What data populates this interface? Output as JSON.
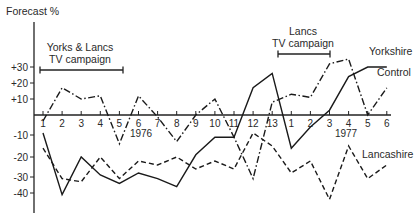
{
  "chart_data": {
    "type": "line",
    "title": "",
    "ylabel": "Forecast %",
    "xlabel": "",
    "ylim": [
      -45,
      40
    ],
    "grid": false,
    "legend": "inline labels at right end of lines",
    "y_ticks": [
      {
        "value": 30,
        "label": "+30",
        "py": 67
      },
      {
        "value": 20,
        "label": "+20",
        "py": 83
      },
      {
        "value": 10,
        "label": "+10",
        "py": 99
      },
      {
        "value": 0,
        "label": "",
        "py": 115
      },
      {
        "value": -10,
        "label": "-10",
        "py": 135
      },
      {
        "value": -20,
        "label": "-20",
        "py": 157
      },
      {
        "value": -30,
        "label": "-30",
        "py": 177
      },
      {
        "value": -40,
        "label": "-40",
        "py": 193
      }
    ],
    "categories": [
      "1",
      "2",
      "3",
      "4",
      "5",
      "6",
      "7",
      "8",
      "9",
      "10",
      "11",
      "12",
      "13",
      "1",
      "2",
      "3",
      "4",
      "5",
      "6"
    ],
    "year_labels": [
      {
        "label": "1976",
        "x": 141,
        "y": 137
      },
      {
        "label": "1977",
        "x": 346,
        "y": 137
      }
    ],
    "series": [
      {
        "name": "Yorkshire",
        "style": "solid",
        "values": [
          -9,
          -41,
          -20,
          -29,
          -34,
          -28,
          -31,
          -36,
          -19,
          -11,
          -11,
          17,
          26,
          -16,
          -6,
          3,
          24,
          30,
          30
        ]
      },
      {
        "name": "Lancashire",
        "style": "dashed",
        "values": [
          -16,
          -31,
          -33,
          -20,
          -31,
          -22,
          -24,
          -20,
          -26,
          -22,
          -26,
          -9,
          -15,
          -28,
          -22,
          -44,
          -15,
          -31,
          -24
        ]
      },
      {
        "name": "Control",
        "style": "dash-dot",
        "values": [
          -3,
          17,
          10,
          12,
          -14,
          12,
          -1,
          -13,
          0,
          10,
          -11,
          -31,
          8,
          13,
          11,
          32,
          35,
          0,
          17
        ]
      }
    ],
    "series_labels": [
      {
        "name": "Yorkshire",
        "x": 369,
        "y": 55
      },
      {
        "name": "Control",
        "x": 377,
        "y": 76
      },
      {
        "name": "Lancashire",
        "x": 362,
        "y": 158
      }
    ],
    "annotations": [
      {
        "lines": [
          "Yorks & Lancs",
          "TV campaign"
        ],
        "text_x": 80,
        "text_y": [
          51,
          63
        ],
        "bar": {
          "x1": 40,
          "x2": 123,
          "y": 70
        }
      },
      {
        "lines": [
          "Lancs",
          "TV campaign"
        ],
        "text_x": 303,
        "text_y": [
          35,
          47
        ],
        "bar": {
          "x1": 278,
          "x2": 330,
          "y": 54
        }
      }
    ]
  }
}
